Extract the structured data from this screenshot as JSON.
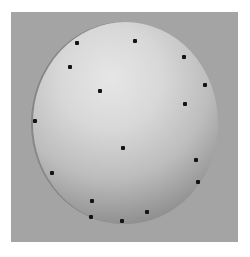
{
  "image": {
    "subject": "shaded gray sphere with scattered black marker dots",
    "background_color": "#ffffff",
    "panel_color": "#a4a4a4",
    "sphere_highlight_color": "#e6e6e6",
    "sphere_shadow_color": "#6f6f6f",
    "dot_color": "#141414"
  },
  "dots": [
    {
      "x": 77,
      "y": 43
    },
    {
      "x": 70,
      "y": 67
    },
    {
      "x": 100,
      "y": 91
    },
    {
      "x": 135,
      "y": 41
    },
    {
      "x": 184,
      "y": 57
    },
    {
      "x": 205,
      "y": 85
    },
    {
      "x": 185,
      "y": 104
    },
    {
      "x": 35,
      "y": 121
    },
    {
      "x": 123,
      "y": 148
    },
    {
      "x": 52,
      "y": 173
    },
    {
      "x": 196,
      "y": 160
    },
    {
      "x": 198,
      "y": 182
    },
    {
      "x": 92,
      "y": 201
    },
    {
      "x": 91,
      "y": 217
    },
    {
      "x": 147,
      "y": 212
    },
    {
      "x": 122,
      "y": 221
    }
  ]
}
